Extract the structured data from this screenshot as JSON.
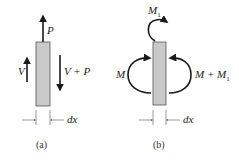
{
  "figure": {
    "panel_a": {
      "caption": "(a)",
      "force_top": "P",
      "shear_left": "V",
      "shear_right": "V + P",
      "width_label": "dx"
    },
    "panel_b": {
      "caption": "(b)",
      "moment_top": "M",
      "moment_top_sub": "1",
      "moment_left": "M",
      "moment_right": "M + M",
      "moment_right_sub": "1",
      "width_label": "dx"
    },
    "colors": {
      "element_fill": "#c9c9c9",
      "element_stroke": "#555555",
      "arrow": "#1a1a1a"
    }
  }
}
